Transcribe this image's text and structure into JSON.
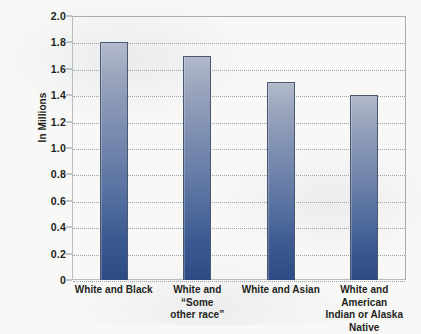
{
  "chart_data": {
    "type": "bar",
    "title": "",
    "xlabel": "",
    "ylabel": "In Millions",
    "ylim": [
      0,
      2.0
    ],
    "ytick_step": 0.2,
    "grid": true,
    "legend": "none",
    "categories": [
      "White and Black",
      "White and “Some other race”",
      "White and Asian",
      "White and American Indian or Alaska Native"
    ],
    "category_lines": [
      [
        "White and Black"
      ],
      [
        "White and “Some",
        "other race”"
      ],
      [
        "White and Asian"
      ],
      [
        "White and American",
        "Indian or Alaska",
        "Native"
      ]
    ],
    "values": [
      1.8,
      1.7,
      1.5,
      1.4
    ],
    "ytick_labels": [
      "2.0",
      "1.8",
      "1.6",
      "1.4",
      "1.2",
      "1.0",
      "0.8",
      "0.6",
      "0.4",
      "0.2",
      "0"
    ],
    "ytick_values": [
      2.0,
      1.8,
      1.6,
      1.4,
      1.2,
      1.0,
      0.8,
      0.6,
      0.4,
      0.2,
      0
    ],
    "colors": {
      "bar_top": "#b2bacb",
      "bar_bottom": "#2d4a85",
      "bar_border": "#4a5770",
      "gridline": "#9b9ea4",
      "plot_border": "#b9bcc0",
      "text": "#231f20",
      "background": "#f8f8f6"
    }
  }
}
